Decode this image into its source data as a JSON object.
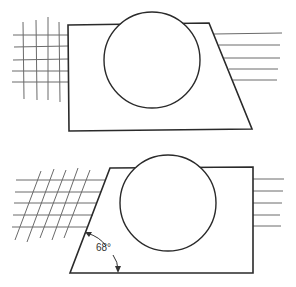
{
  "figure": {
    "top_figure": {
      "shape": "trapezoid with slanted right edge",
      "left_side": "grid of crossing horizontal and vertical lines",
      "right_side": "five horizontal lines"
    },
    "bottom_figure": {
      "shape": "trapezoid with slanted left edge",
      "left_side": "grid of horizontal lines crossed by slanted lines",
      "right_side": "five horizontal lines",
      "angle_annotation": {
        "label": "68°",
        "value_degrees": 68
      }
    }
  },
  "colors": {
    "stroke": "#2a2a2a",
    "hatch": "#6a6a6a",
    "background": "#ffffff"
  }
}
